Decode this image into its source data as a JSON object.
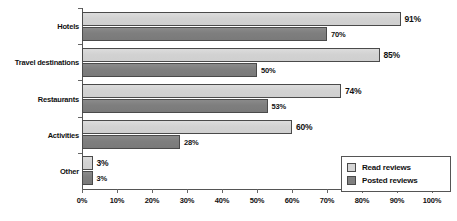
{
  "chart_data": {
    "type": "bar",
    "orientation": "horizontal",
    "title": "",
    "xlabel": "",
    "ylabel": "",
    "xlim": [
      0,
      100
    ],
    "grid": false,
    "legend_position": "bottom-right",
    "categories": [
      "Hotels",
      "Travel destinations",
      "Restaurants",
      "Activities",
      "Other"
    ],
    "xticks": [
      "0%",
      "10%",
      "20%",
      "30%",
      "40%",
      "50%",
      "60%",
      "70%",
      "80%",
      "90%",
      "100%"
    ],
    "xtick_values": [
      0,
      10,
      20,
      30,
      40,
      50,
      60,
      70,
      80,
      90,
      100
    ],
    "series": [
      {
        "name": "Read reviews",
        "color": "#d4d4d4",
        "values": [
          91,
          85,
          74,
          60,
          3
        ],
        "labels": [
          "91%",
          "85%",
          "74%",
          "60%",
          "3%"
        ]
      },
      {
        "name": "Posted reviews",
        "color": "#808080",
        "values": [
          70,
          50,
          53,
          28,
          3
        ],
        "labels": [
          "70%",
          "50%",
          "53%",
          "28%",
          "3%"
        ]
      }
    ]
  },
  "legend": {
    "items": [
      {
        "label": "Read reviews",
        "swatch": "read"
      },
      {
        "label": "Posted reviews",
        "swatch": "posted"
      }
    ]
  }
}
